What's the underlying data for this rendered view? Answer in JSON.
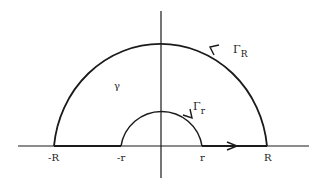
{
  "diagram": {
    "type": "contour-integration-indented-semicircle",
    "labels": {
      "neg_R": "-R",
      "neg_r": "-r",
      "pos_r": "r",
      "pos_R": "R",
      "gamma": "γ",
      "Gamma": "Γ",
      "sub_R": "R",
      "sub_r": "r"
    },
    "colors": {
      "stroke": "#1a1a1a",
      "background": "#ffffff"
    }
  }
}
